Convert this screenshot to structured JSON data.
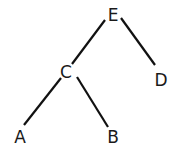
{
  "diagram": {
    "type": "binary-tree",
    "colors": {
      "edge": "#111111",
      "label": "#1a1a1a",
      "background": "#ffffff"
    },
    "nodes": [
      {
        "id": "E",
        "label": "E"
      },
      {
        "id": "C",
        "label": "C"
      },
      {
        "id": "D",
        "label": "D"
      },
      {
        "id": "A",
        "label": "A"
      },
      {
        "id": "B",
        "label": "B"
      }
    ],
    "edges": [
      {
        "from": "E",
        "to": "C"
      },
      {
        "from": "E",
        "to": "D"
      },
      {
        "from": "C",
        "to": "A"
      },
      {
        "from": "C",
        "to": "B"
      }
    ]
  }
}
